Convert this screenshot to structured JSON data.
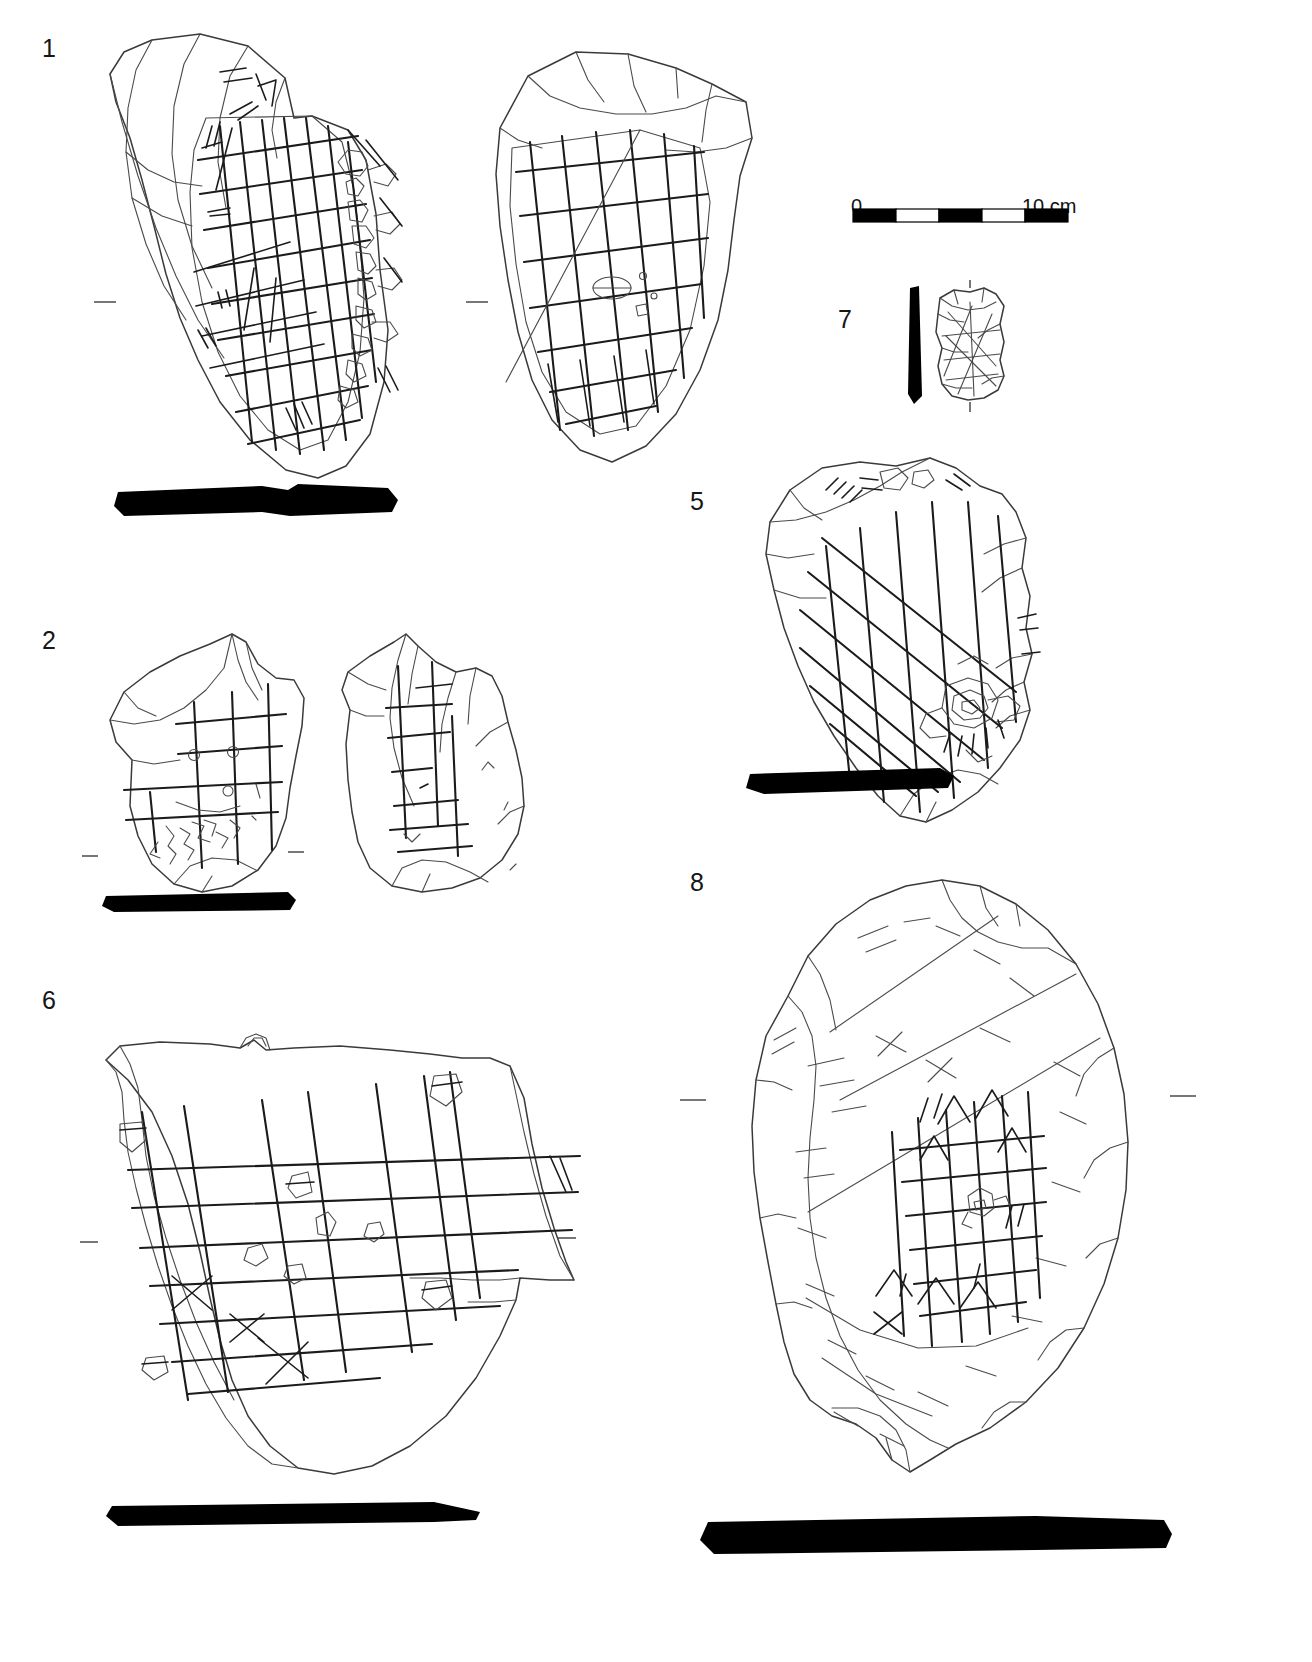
{
  "plate": {
    "background_color": "#ffffff",
    "ink_color": "#1b1b1b",
    "description": "Archaeological line drawing plate of incised stone plaquettes with lattice/grid engravings"
  },
  "scale": {
    "name": "scale-bar",
    "min_label": "0",
    "max_label": "10 cm",
    "units": "cm",
    "length_cm": 10,
    "segments": 5,
    "segment_colors": [
      "#000000",
      "#ffffff",
      "#000000",
      "#ffffff",
      "#000000"
    ]
  },
  "figures": [
    {
      "id": "1",
      "label": "1",
      "views": 2,
      "view_names": [
        "obverse",
        "reverse"
      ],
      "has_profile_bar": true,
      "motif": "dense cross-hatched lattice grid with zoomorphic engraving at right edge"
    },
    {
      "id": "2",
      "label": "2",
      "views": 2,
      "view_names": [
        "obverse",
        "reverse"
      ],
      "has_profile_bar": true,
      "motif": "open rectilinear grid with ringed intersections and filamentary scratches"
    },
    {
      "id": "5",
      "label": "5",
      "views": 1,
      "view_names": [
        "obverse"
      ],
      "has_profile_bar": true,
      "motif": "diagonal lattice grid with zoomorphic head at lower right"
    },
    {
      "id": "6",
      "label": "6",
      "views": 1,
      "view_names": [
        "obverse"
      ],
      "has_profile_bar": true,
      "motif": "wide orthogonal grid with small looped glyphs and X marks at intersections"
    },
    {
      "id": "7",
      "label": "7",
      "views": 1,
      "view_names": [
        "obverse"
      ],
      "has_profile_bar": true,
      "motif": "small fragment with faint crossed lattice"
    },
    {
      "id": "8",
      "label": "8",
      "views": 1,
      "view_names": [
        "obverse"
      ],
      "has_profile_bar": true,
      "motif": "large cobble with faint scattered striations and central fine grid"
    }
  ]
}
